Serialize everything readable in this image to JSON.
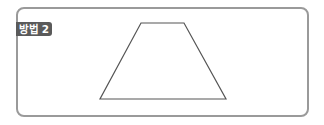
{
  "label": "방법 2",
  "colors": {
    "frame": "#9a9a9a",
    "badge_bg": "#5a5a5a",
    "badge_text": "#ffffff",
    "shape_stroke": "#555555"
  },
  "shape": {
    "type": "trapezoid",
    "points": "141,23 184,23 226,99 100,99"
  }
}
